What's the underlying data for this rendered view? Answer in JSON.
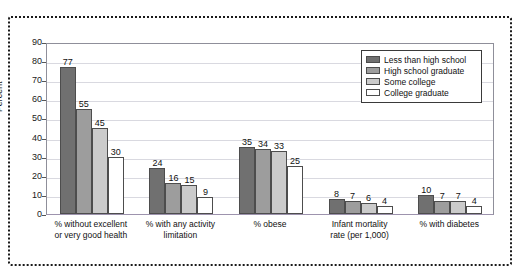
{
  "chart_data": {
    "type": "bar",
    "title": "",
    "subtitle": "",
    "xlabel": "",
    "ylabel": "Percent",
    "ylim": [
      0,
      90
    ],
    "ytick_values": [
      0,
      10,
      20,
      30,
      40,
      50,
      60,
      70,
      80,
      90
    ],
    "ytick_labels": [
      "0",
      "10",
      "20",
      "30",
      "40",
      "50",
      "60",
      "70",
      "80",
      "90"
    ],
    "grid": true,
    "legend_position": "top-right",
    "categories": [
      "% without excellent\nor very good health",
      "% with any activity\nlimitation",
      "% obese",
      "Infant mortality\nrate (per 1,000)",
      "% with diabetes"
    ],
    "series": [
      {
        "name": "Less than high school",
        "color": "#707070",
        "values": [
          77,
          24,
          35,
          8,
          10
        ]
      },
      {
        "name": "High school graduate",
        "color": "#9d9d9d",
        "values": [
          55,
          16,
          34,
          7,
          7
        ]
      },
      {
        "name": "Some college",
        "color": "#cbcbcb",
        "values": [
          45,
          15,
          33,
          6,
          7
        ]
      },
      {
        "name": "College graduate",
        "color": "#ffffff",
        "values": [
          30,
          9,
          25,
          4,
          4
        ]
      }
    ]
  },
  "legend": {
    "items": [
      {
        "label": "Less than high school"
      },
      {
        "label": "High school graduate"
      },
      {
        "label": "Some college"
      },
      {
        "label": "College graduate"
      }
    ]
  }
}
